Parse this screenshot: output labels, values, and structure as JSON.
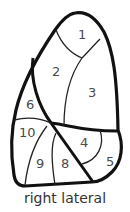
{
  "diagram": {
    "caption": "right lateral",
    "segments": [
      {
        "id": "1",
        "label": "1"
      },
      {
        "id": "2",
        "label": "2"
      },
      {
        "id": "3",
        "label": "3"
      },
      {
        "id": "4",
        "label": "4"
      },
      {
        "id": "5",
        "label": "5"
      },
      {
        "id": "6",
        "label": "6"
      },
      {
        "id": "8",
        "label": "8"
      },
      {
        "id": "9",
        "label": "9"
      },
      {
        "id": "10",
        "label": "10"
      }
    ],
    "colors": {
      "stroke": "#111111",
      "text": "#4a4a4a",
      "background": "#ffffff"
    }
  }
}
